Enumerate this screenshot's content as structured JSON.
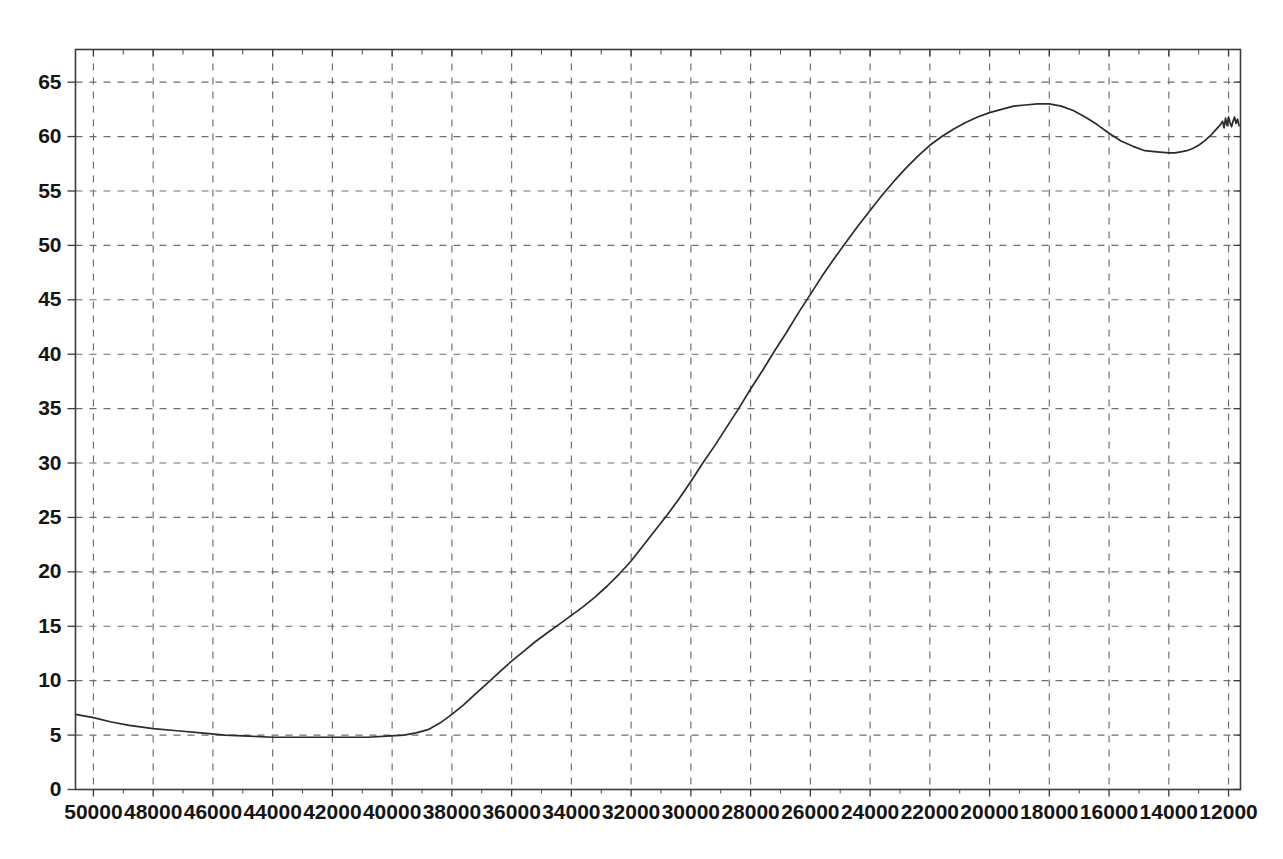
{
  "chart_data": {
    "type": "line",
    "title": "",
    "subtitle": "",
    "xlabel": "",
    "ylabel": "",
    "grid": true,
    "legend": null,
    "x_axis_reversed": true,
    "xlim": [
      50600,
      11600
    ],
    "ylim": [
      0,
      68.0
    ],
    "xticks": [
      50000,
      48000,
      46000,
      44000,
      42000,
      40000,
      38000,
      36000,
      34000,
      32000,
      30000,
      28000,
      26000,
      24000,
      22000,
      20000,
      18000,
      16000,
      14000,
      12000
    ],
    "xtick_labels": [
      "50000",
      "48000",
      "46000",
      "44000",
      "42000",
      "40000",
      "38000",
      "36000",
      "34000",
      "32000",
      "30000",
      "28000",
      "26000",
      "24000",
      "22000",
      "20000",
      "18000",
      "16000",
      "14000",
      "12000"
    ],
    "yticks": [
      0,
      5,
      10,
      15,
      20,
      25,
      30,
      35,
      40,
      45,
      50,
      55,
      60,
      65
    ],
    "ytick_labels": [
      "0",
      "5",
      "10",
      "15",
      "20",
      "25",
      "30",
      "35",
      "40",
      "45",
      "50",
      "55",
      "60",
      "65"
    ],
    "series": [
      {
        "name": "transmittance",
        "color": "#2b2b2b",
        "x": [
          50600,
          50000,
          49400,
          48800,
          48000,
          47200,
          46400,
          45600,
          44800,
          44000,
          43200,
          42400,
          41600,
          40800,
          40200,
          39600,
          39200,
          38800,
          38400,
          38000,
          37600,
          37200,
          36800,
          36400,
          36000,
          35600,
          35200,
          34800,
          34400,
          34000,
          33600,
          33200,
          32800,
          32400,
          32000,
          31600,
          31200,
          30800,
          30400,
          30000,
          29600,
          29200,
          28800,
          28400,
          28000,
          27600,
          27200,
          26800,
          26400,
          26000,
          25600,
          25200,
          24800,
          24400,
          24000,
          23600,
          23200,
          22800,
          22400,
          22000,
          21600,
          21200,
          20800,
          20400,
          20000,
          19600,
          19200,
          18800,
          18400,
          18000,
          17600,
          17200,
          16800,
          16400,
          16000,
          15600,
          15200,
          14800,
          14400,
          14000,
          13800,
          13600,
          13400,
          13200,
          13000,
          12800,
          12600,
          12400,
          12300,
          12200,
          12150,
          12100,
          12050,
          12000,
          11950,
          11900,
          11850,
          11800,
          11750,
          11700,
          11650
        ],
        "y": [
          6.9,
          6.6,
          6.2,
          5.9,
          5.6,
          5.4,
          5.2,
          5.0,
          4.9,
          4.8,
          4.8,
          4.8,
          4.8,
          4.8,
          4.9,
          5.0,
          5.2,
          5.5,
          6.1,
          6.9,
          7.8,
          8.8,
          9.8,
          10.8,
          11.8,
          12.7,
          13.6,
          14.4,
          15.2,
          16.0,
          16.8,
          17.7,
          18.7,
          19.8,
          21.0,
          22.4,
          23.8,
          25.2,
          26.7,
          28.3,
          30.0,
          31.6,
          33.3,
          35.0,
          36.8,
          38.5,
          40.3,
          42.0,
          43.8,
          45.5,
          47.2,
          48.8,
          50.3,
          51.8,
          53.2,
          54.6,
          55.9,
          57.1,
          58.2,
          59.2,
          60.0,
          60.7,
          61.3,
          61.8,
          62.2,
          62.5,
          62.8,
          62.9,
          63.0,
          63.0,
          62.8,
          62.4,
          61.8,
          61.1,
          60.3,
          59.6,
          59.1,
          58.7,
          58.6,
          58.5,
          58.5,
          58.6,
          58.7,
          58.9,
          59.2,
          59.6,
          60.1,
          60.7,
          61.0,
          61.4,
          60.8,
          61.7,
          61.0,
          61.8,
          61.3,
          60.9,
          61.4,
          61.8,
          61.2,
          61.6,
          61.0
        ]
      }
    ],
    "annotations": []
  },
  "axes": {
    "x_tick_labels": [
      "50000",
      "48000",
      "46000",
      "44000",
      "42000",
      "40000",
      "38000",
      "36000",
      "34000",
      "32000",
      "30000",
      "28000",
      "26000",
      "24000",
      "22000",
      "20000",
      "18000",
      "16000",
      "14000",
      "12000"
    ],
    "y_tick_labels": [
      "65",
      "60",
      "55",
      "50",
      "45",
      "40",
      "35",
      "30",
      "25",
      "20",
      "15",
      "10",
      "5",
      "0"
    ]
  }
}
